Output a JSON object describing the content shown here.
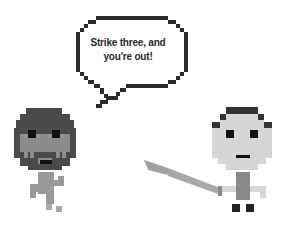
{
  "speech_bubble": {
    "line1": "Strike three, and",
    "line2": "you're out!"
  },
  "characters": [
    {
      "name": "catcher",
      "description": "pixel character with dark helmet and face mask"
    },
    {
      "name": "batter",
      "description": "pixel character holding a bat"
    }
  ],
  "colors": {
    "outline": "#2b2b2b",
    "helmet": "#4a4a4a",
    "catcher_skin": "#8c8c8c",
    "batter_skin": "#d6d6d6",
    "bat": "#9e9e9e",
    "eyes": "#111111"
  }
}
